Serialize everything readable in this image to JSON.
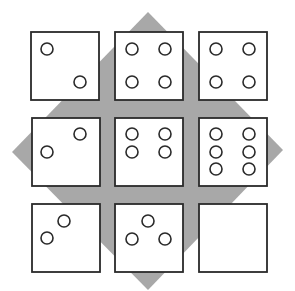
{
  "figure": {
    "colors": {
      "diamond": "#a8a8a8",
      "tile_border": "#2a2a2a",
      "tile_fill": "#ffffff"
    },
    "diamond": {
      "top": [
        148,
        12
      ],
      "right": [
        283,
        150
      ],
      "bottom": [
        148,
        290
      ],
      "left": [
        12,
        152
      ]
    },
    "tile_size": 68,
    "tiles": [
      {
        "row": 0,
        "col": 0,
        "x": 31,
        "y": 32,
        "pips": [
          [
            47,
            49
          ],
          [
            80,
            82
          ]
        ]
      },
      {
        "row": 0,
        "col": 1,
        "x": 115,
        "y": 32,
        "pips": [
          [
            132,
            49
          ],
          [
            165,
            49
          ],
          [
            132,
            82
          ],
          [
            165,
            82
          ]
        ]
      },
      {
        "row": 0,
        "col": 2,
        "x": 199,
        "y": 32,
        "pips": [
          [
            216,
            49
          ],
          [
            249,
            49
          ],
          [
            216,
            82
          ],
          [
            249,
            82
          ]
        ]
      },
      {
        "row": 1,
        "col": 0,
        "x": 32,
        "y": 118,
        "pips": [
          [
            80,
            134
          ],
          [
            47,
            152
          ]
        ]
      },
      {
        "row": 1,
        "col": 1,
        "x": 115,
        "y": 118,
        "pips": [
          [
            132,
            134
          ],
          [
            165,
            134
          ],
          [
            132,
            152
          ],
          [
            165,
            152
          ]
        ]
      },
      {
        "row": 1,
        "col": 2,
        "x": 199,
        "y": 118,
        "pips": [
          [
            216,
            134
          ],
          [
            249,
            134
          ],
          [
            216,
            152
          ],
          [
            249,
            152
          ],
          [
            216,
            169
          ],
          [
            249,
            169
          ]
        ]
      },
      {
        "row": 2,
        "col": 0,
        "x": 32,
        "y": 204,
        "pips": [
          [
            64,
            221
          ],
          [
            47,
            238
          ]
        ]
      },
      {
        "row": 2,
        "col": 1,
        "x": 115,
        "y": 204,
        "pips": [
          [
            148,
            221
          ],
          [
            132,
            239
          ],
          [
            165,
            239
          ]
        ]
      },
      {
        "row": 2,
        "col": 2,
        "x": 199,
        "y": 204,
        "pips": []
      }
    ],
    "pip_radius": 6
  }
}
